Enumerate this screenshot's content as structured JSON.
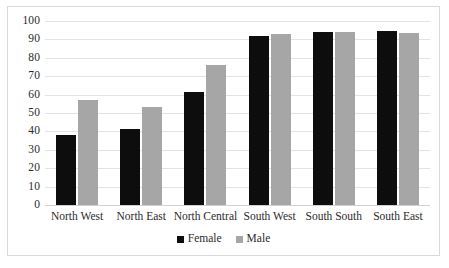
{
  "chart_data": {
    "type": "bar",
    "title": "",
    "subtitle": "",
    "xlabel": "",
    "ylabel": "",
    "categories": [
      "North West",
      "North East",
      "North Central",
      "South West",
      "South South",
      "South East"
    ],
    "series": [
      {
        "name": "Female",
        "color": "#0d0d0d",
        "values": [
          38,
          41.5,
          61.5,
          92,
          94,
          94.5
        ]
      },
      {
        "name": "Male",
        "color": "#a6a6a6",
        "values": [
          57,
          53,
          76,
          93,
          94,
          93.5
        ]
      }
    ],
    "ylim": [
      0,
      100
    ],
    "ytick_step": 10,
    "yticks": [
      "100",
      "90",
      "80",
      "70",
      "60",
      "50",
      "40",
      "30",
      "20",
      "10",
      "0"
    ],
    "grid": "horizontal",
    "legend_position": "bottom-center",
    "legend": [
      "Female",
      "Male"
    ],
    "annotations": []
  },
  "colors": {
    "female_bar": "#0d0d0d",
    "male_bar": "#a6a6a6",
    "gridline": "#e3e3e3",
    "frame_border": "#d9d9d9",
    "text": "#2b2b2b",
    "background": "#ffffff"
  }
}
